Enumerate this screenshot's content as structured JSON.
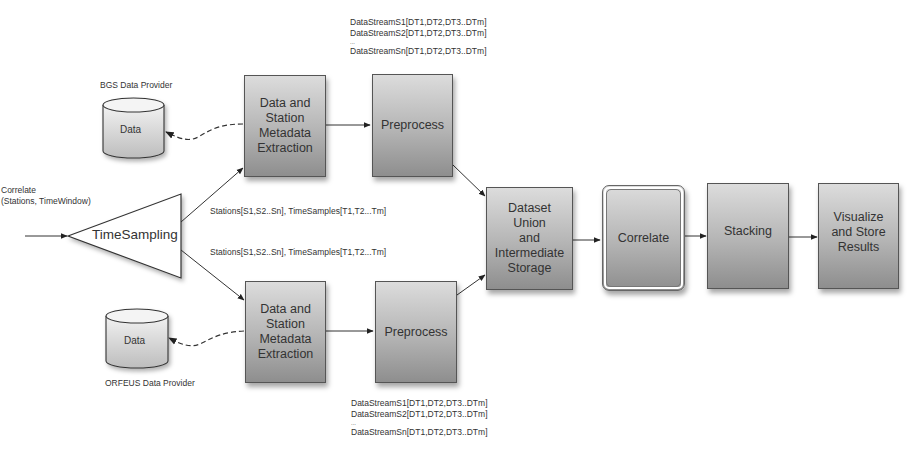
{
  "diagram": {
    "input_label": [
      "Correlate",
      "(Stations, TimeWindow)"
    ],
    "time_sampling": {
      "label": "TimeSampling"
    },
    "providers": {
      "top": {
        "name": "BGS Data Provider",
        "store_label": "Data"
      },
      "bottom": {
        "name": "ORFEUS Data Provider",
        "store_label": "Data"
      }
    },
    "edge_labels": {
      "to_top_extraction": "Stations[S1,S2..Sn], TimeSamples[T1,T2...Tm]",
      "to_bottom_extraction": "Stations[S1,S2..Sn], TimeSamples[T1,T2...Tm]"
    },
    "top_branch": {
      "extraction": {
        "lines": [
          "Data and",
          "Station",
          "Metadata",
          "Extraction"
        ]
      },
      "preprocess": {
        "label": "Preprocess"
      },
      "streams": [
        "DataStreamS1[DT1,DT2,DT3..DTm]",
        "DataStreamS2[DT1,DT2,DT3..DTm]",
        "...",
        "DataStreamSn[DT1,DT2,DT3..DTm]"
      ]
    },
    "bottom_branch": {
      "extraction": {
        "lines": [
          "Data and",
          "Station",
          "Metadata",
          "Extraction"
        ]
      },
      "preprocess": {
        "label": "Preprocess"
      },
      "streams": [
        "DataStreamS1[DT1,DT2,DT3..DTm]",
        "DataStreamS2[DT1,DT2,DT3..DTm]",
        "...",
        "DataStreamSn[DT1,DT2,DT3..DTm]"
      ]
    },
    "union": {
      "lines": [
        "Dataset",
        "Union",
        "and",
        "Intermediate",
        "Storage"
      ]
    },
    "correlate": {
      "label": "Correlate"
    },
    "stacking": {
      "label": "Stacking"
    },
    "visualize": {
      "lines": [
        "Visualize",
        "and Store",
        "Results"
      ]
    }
  }
}
